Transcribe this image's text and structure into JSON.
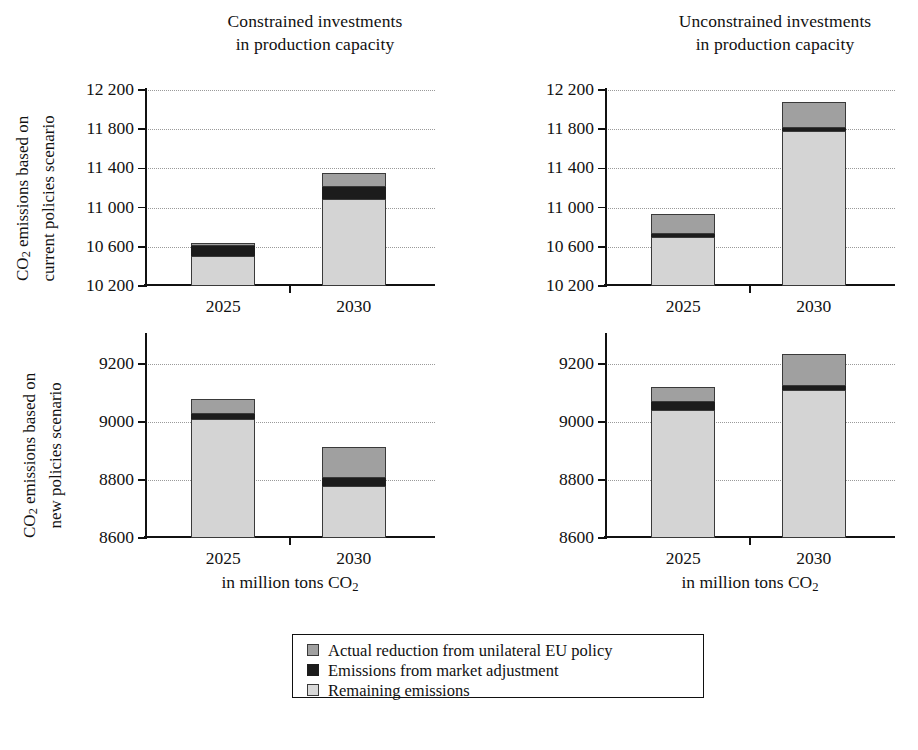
{
  "figure": {
    "column_titles": [
      {
        "line1": "Constrained investments",
        "line2": "in production capacity"
      },
      {
        "line1": "Unconstrained investments",
        "line2": "in production capacity"
      }
    ],
    "row_labels": [
      {
        "line1": "CO2 emissions based on",
        "line2": "current policies scenario"
      },
      {
        "line1": "CO2 emissions based on",
        "line2": "new policies scenario"
      }
    ],
    "x_axis_caption": "in million tons CO2",
    "colors": {
      "reduction": "#a0a0a0",
      "market": "#1c1c1c",
      "remaining": "#d4d4d4",
      "axis": "#111111",
      "grid": "#9a9a9a"
    }
  },
  "legend": {
    "entries": [
      {
        "key": "reduction",
        "label": "Actual reduction from unilateral EU policy",
        "swatch": "medium-gray"
      },
      {
        "key": "market",
        "label": "Emissions from market adjustment",
        "swatch": "black"
      },
      {
        "key": "remaining",
        "label": "Remaining emissions",
        "swatch": "light-gray"
      }
    ]
  },
  "chart_data": [
    {
      "id": "top-left",
      "type": "bar",
      "stacked": true,
      "title": "Constrained investments in production capacity",
      "ylabel": "CO2 emissions based on current policies scenario",
      "xlabel": "in million tons CO2",
      "categories": [
        "2025",
        "2030"
      ],
      "ylim": [
        10200,
        12200
      ],
      "yticks": [
        10200,
        10600,
        11000,
        11400,
        11800,
        12200
      ],
      "ytick_labels": [
        "10 200",
        "10 600",
        "11 000",
        "11 400",
        "11 800",
        "12 200"
      ],
      "grid": true,
      "legend_position": "bottom-center-shared",
      "series": [
        {
          "name": "Remaining emissions",
          "color": "#d4d4d4",
          "values": [
            10510,
            11090
          ]
        },
        {
          "name": "Emissions from market adjustment",
          "color": "#1c1c1c",
          "values": [
            100,
            120
          ]
        },
        {
          "name": "Actual reduction from unilateral EU policy",
          "color": "#a0a0a0",
          "values": [
            30,
            140
          ]
        }
      ],
      "totals": [
        10640,
        11350
      ]
    },
    {
      "id": "top-right",
      "type": "bar",
      "stacked": true,
      "title": "Unconstrained investments in production capacity",
      "ylabel": "CO2 emissions based on current policies scenario",
      "xlabel": "in million tons CO2",
      "categories": [
        "2025",
        "2030"
      ],
      "ylim": [
        10200,
        12200
      ],
      "yticks": [
        10200,
        10600,
        11000,
        11400,
        11800,
        12200
      ],
      "ytick_labels": [
        "10 200",
        "10 600",
        "11 000",
        "11 400",
        "11 800",
        "12 200"
      ],
      "grid": true,
      "legend_position": "bottom-center-shared",
      "series": [
        {
          "name": "Remaining emissions",
          "color": "#d4d4d4",
          "values": [
            10700,
            11780
          ]
        },
        {
          "name": "Emissions from market adjustment",
          "color": "#1c1c1c",
          "values": [
            30,
            30
          ]
        },
        {
          "name": "Actual reduction from unilateral EU policy",
          "color": "#a0a0a0",
          "values": [
            200,
            270
          ]
        }
      ],
      "totals": [
        10930,
        12080
      ]
    },
    {
      "id": "bottom-left",
      "type": "bar",
      "stacked": true,
      "title": "Constrained investments in production capacity",
      "ylabel": "CO2 emissions based on new policies scenario",
      "xlabel": "in million tons CO2",
      "categories": [
        "2025",
        "2030"
      ],
      "ylim": [
        8600,
        9300
      ],
      "yticks": [
        8600,
        8800,
        9000,
        9200
      ],
      "ytick_labels": [
        "8600",
        "8800",
        "9000",
        "9200"
      ],
      "grid": true,
      "legend_position": "bottom-center-shared",
      "series": [
        {
          "name": "Remaining emissions",
          "color": "#d4d4d4",
          "values": [
            9010,
            8780
          ]
        },
        {
          "name": "Emissions from market adjustment",
          "color": "#1c1c1c",
          "values": [
            17,
            28
          ]
        },
        {
          "name": "Actual reduction from unilateral EU policy",
          "color": "#a0a0a0",
          "values": [
            53,
            107
          ]
        }
      ],
      "totals": [
        9080,
        8915
      ]
    },
    {
      "id": "bottom-right",
      "type": "bar",
      "stacked": true,
      "title": "Unconstrained investments in production capacity",
      "ylabel": "CO2 emissions based on new policies scenario",
      "xlabel": "in million tons CO2",
      "categories": [
        "2025",
        "2030"
      ],
      "ylim": [
        8600,
        9300
      ],
      "yticks": [
        8600,
        8800,
        9000,
        9200
      ],
      "ytick_labels": [
        "8600",
        "8800",
        "9000",
        "9200"
      ],
      "grid": true,
      "legend_position": "bottom-center-shared",
      "series": [
        {
          "name": "Remaining emissions",
          "color": "#d4d4d4",
          "values": [
            9040,
            9110
          ]
        },
        {
          "name": "Emissions from market adjustment",
          "color": "#1c1c1c",
          "values": [
            28,
            15
          ]
        },
        {
          "name": "Actual reduction from unilateral EU policy",
          "color": "#a0a0a0",
          "values": [
            52,
            110
          ]
        }
      ],
      "totals": [
        9120,
        9235
      ]
    }
  ]
}
